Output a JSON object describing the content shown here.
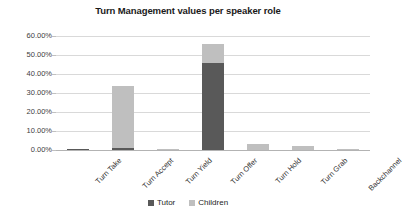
{
  "chart_data": {
    "type": "bar",
    "subtype": "stacked-column",
    "title": "Turn Management values per speaker role",
    "subtitle": "",
    "xlabel": "",
    "ylabel": "",
    "categories": [
      "Turn Take",
      "Turn Accept",
      "Turn Yield",
      "Turn Offer",
      "Turn Hold",
      "Turn Grab",
      "Backchannel"
    ],
    "series": [
      {
        "name": "Tutor",
        "color": "#595959",
        "values": [
          0.0075,
          0.0105,
          0.0,
          0.4605,
          0.0,
          0.0,
          0.0
        ]
      },
      {
        "name": "Children",
        "color": "#bfbfbf",
        "values": [
          0.0,
          0.3275,
          0.0035,
          0.095,
          0.034,
          0.0225,
          0.005
        ]
      }
    ],
    "ylim": [
      0,
      0.6
    ],
    "ytick_values": [
      0,
      0.1,
      0.2,
      0.3,
      0.4,
      0.5,
      0.6
    ],
    "ytick_labels": [
      "0.00%",
      "10.00%",
      "20.00%",
      "30.00%",
      "40.00%",
      "50.00%",
      "60.00%"
    ],
    "ytick_format": "percent-2dp",
    "grid": true,
    "grid_axis": "y",
    "legend_position": "bottom",
    "xlabel_rotation": -45
  },
  "legend": {
    "items": [
      {
        "label": "Tutor",
        "color": "#595959"
      },
      {
        "label": "Children",
        "color": "#bfbfbf"
      }
    ]
  },
  "colors": {
    "tutor": "#595959",
    "children": "#bfbfbf",
    "gridline": "#d9d9d9",
    "axis": "#b3b3b3",
    "text": "#262626",
    "background": "#ffffff"
  }
}
